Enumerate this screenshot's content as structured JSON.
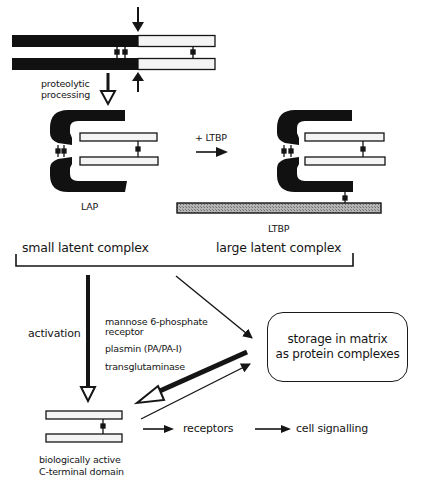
{
  "diagram": {
    "type": "biological pathway schematic (TGF-beta latent complex processing)",
    "colors": {
      "ink": "#151515",
      "latency_associated_peptide": "#111111",
      "mature_domain_fill": "#f4f4f4",
      "ltbp_fill": "#9a9a9a",
      "background": "#ffffff"
    },
    "nodes": [
      {
        "id": "precursor",
        "description": "dimeric precursor: two bars, dark N-terminal part + light C-terminal part, linked by disulfide bonds; cleavage arrows at junction"
      },
      {
        "id": "small_latent_complex",
        "label": "LAP"
      },
      {
        "id": "large_latent_complex",
        "label": "LTBP"
      },
      {
        "id": "storage",
        "label": "storage in matrix as protein complexes"
      },
      {
        "id": "active_domain",
        "label": "biologically active C-terminal domain"
      },
      {
        "id": "receptors",
        "label": "receptors"
      },
      {
        "id": "cell_signalling",
        "label": "cell signalling"
      }
    ],
    "edges": [
      {
        "from": "precursor",
        "to": "small_latent_complex",
        "label": "proteolytic processing",
        "style": "open-head"
      },
      {
        "from": "small_latent_complex",
        "to": "large_latent_complex",
        "label": "+ LTBP",
        "style": "solid"
      },
      {
        "from": "small_latent_complex",
        "to": "active_domain",
        "label": "activation",
        "style": "thick open-head"
      },
      {
        "from": "large_latent_complex",
        "to": "storage",
        "style": "solid"
      },
      {
        "from": "storage",
        "to": "active_domain",
        "style": "thick open-head"
      },
      {
        "from": "active_domain",
        "to": "storage",
        "style": "solid"
      },
      {
        "from": "active_domain",
        "to": "receptors",
        "style": "solid"
      },
      {
        "from": "receptors",
        "to": "cell_signalling",
        "style": "solid"
      }
    ]
  },
  "labels": {
    "proteolytic_1": "proteolytic",
    "proteolytic_2": "processing",
    "plus_ltbp": "+ LTBP",
    "lap": "LAP",
    "ltbp": "LTBP",
    "small_latent_complex": "small latent complex",
    "large_latent_complex": "large latent complex",
    "activation": "activation",
    "activators": {
      "m6p_1": "mannose 6-phosphate",
      "m6p_2": "receptor",
      "plasmin": "plasmin (PA/PA-I)",
      "transglutaminase": "transglutaminase"
    },
    "storage_1": "storage in matrix",
    "storage_2": "as protein complexes",
    "active_1": "biologically active",
    "active_2": "C-terminal domain",
    "receptors": "receptors",
    "cell_signalling": "cell signalling"
  }
}
